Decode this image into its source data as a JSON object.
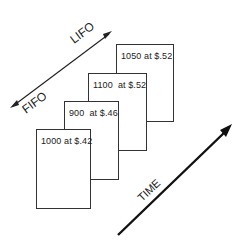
{
  "diagram": {
    "cards": [
      {
        "label": "1050 at $.52",
        "left": 116,
        "top": 44,
        "width": 58,
        "height": 78
      },
      {
        "label": "1100  at $.52",
        "left": 88,
        "top": 73,
        "width": 59,
        "height": 78
      },
      {
        "label": "900  at $.46",
        "left": 64,
        "top": 101,
        "width": 55,
        "height": 79
      },
      {
        "label": "1000 at $.42",
        "left": 36,
        "top": 129,
        "width": 55,
        "height": 80
      }
    ],
    "method_axis": {
      "start_label": "FIFO",
      "end_label": "LIFO"
    },
    "time_axis": {
      "label": "TIME"
    },
    "colors": {
      "stroke": "#222222",
      "background": "#ffffff"
    }
  }
}
